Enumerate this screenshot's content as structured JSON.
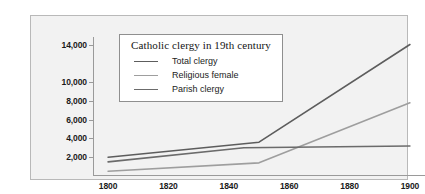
{
  "chart_data": {
    "type": "line",
    "title": "Catholic clergy in 19th century",
    "xlabel": "",
    "ylabel": "",
    "x": [
      1800,
      1850,
      1900
    ],
    "xlim": [
      1795,
      1905
    ],
    "ylim": [
      0,
      14800
    ],
    "grid": false,
    "legend_position": "top-left-inside",
    "x_ticks": [
      "1800",
      "1820",
      "1840",
      "1860",
      "1880",
      "1900"
    ],
    "x_tick_values": [
      1800,
      1820,
      1840,
      1860,
      1880,
      1900
    ],
    "y_ticks": [
      "2,000",
      "4,000",
      "6,000",
      "8,000",
      "10,000",
      "14,000"
    ],
    "y_tick_values": [
      2000,
      4000,
      6000,
      8000,
      10000,
      14000
    ],
    "series": [
      {
        "name": "Total clergy",
        "color": "#5d5d5d",
        "x": [
          1800,
          1850,
          1900
        ],
        "values": [
          2000,
          3600,
          14000
        ]
      },
      {
        "name": "Religious female",
        "color": "#9e9e9e",
        "x": [
          1800,
          1850,
          1900
        ],
        "values": [
          500,
          1400,
          7800
        ]
      },
      {
        "name": "Parish clergy",
        "color": "#6b6b6b",
        "x": [
          1800,
          1845,
          1900
        ],
        "values": [
          1500,
          3000,
          3200
        ]
      }
    ]
  },
  "style": {
    "plate_background": "#f2f2f2",
    "plate_border": "#b9b9b9",
    "axis_color": "#9a9a9a",
    "text_color": "#1a1a1a",
    "legend_background": "#ffffff",
    "legend_border": "#8f8f8f"
  }
}
